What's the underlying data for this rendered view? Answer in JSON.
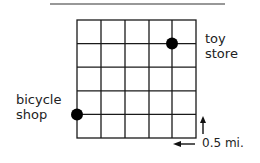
{
  "diagram": {
    "grid": {
      "rows": 5,
      "cols": 5,
      "x": 77,
      "y": 20,
      "cell": 23.8
    },
    "points": [
      {
        "name": "toy store",
        "col": 4,
        "row": 1
      },
      {
        "name": "bicycle shop",
        "col": 0,
        "row": 4
      }
    ],
    "labels": {
      "toy_line1": "toy",
      "toy_line2": "store",
      "bike_line1": "bicycle",
      "bike_line2": "shop",
      "scale": "0.5 mi."
    },
    "colors": {
      "line": "#1a1a1a",
      "dot": "#000000"
    }
  }
}
